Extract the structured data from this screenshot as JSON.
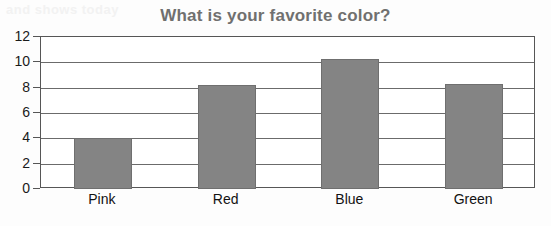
{
  "chart_data": {
    "type": "bar",
    "title": "What is your favorite color?",
    "xlabel": "",
    "ylabel": "",
    "categories": [
      "Pink",
      "Red",
      "Blue",
      "Green"
    ],
    "values": [
      4,
      8.2,
      10.3,
      8.3
    ],
    "ylim": [
      0,
      12
    ],
    "yticks": [
      0,
      2,
      4,
      6,
      8,
      10,
      12
    ],
    "ytick_labels": [
      "0",
      "2",
      "4",
      "6",
      "8",
      "10",
      "12"
    ],
    "grid": true,
    "grid_axis": "y",
    "legend": false,
    "bar_color": "#848484",
    "title_color": "#70706f",
    "axis_color": "#565656",
    "series": [
      {
        "name": "Votes",
        "values": [
          4,
          8.2,
          10.3,
          8.3
        ]
      }
    ]
  },
  "artifacts": {
    "top_text": "and shows today",
    "mid_text": "answered that they wanted to be",
    "right_text": "question"
  }
}
